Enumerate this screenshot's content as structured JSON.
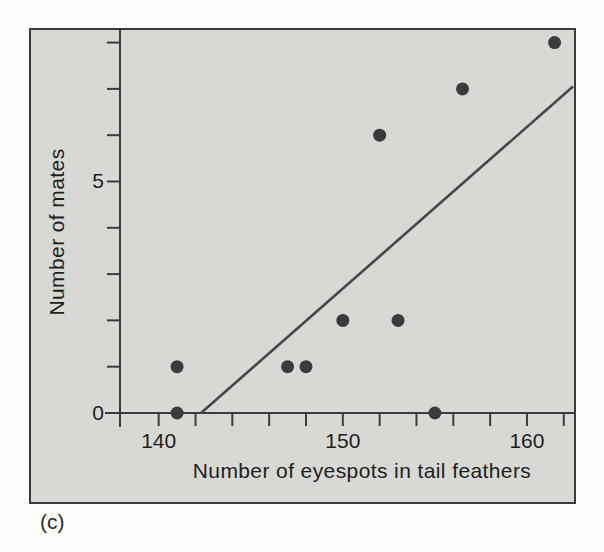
{
  "figure": {
    "caption": "(c)",
    "colors": {
      "page_bg": "#fcfcfa",
      "panel_bg": "#d8d8d4",
      "frame": "#3b3b3b",
      "text": "#1e1e1e"
    }
  },
  "chart_data": {
    "type": "scatter",
    "xlabel": "Number of eyespots in tail feathers",
    "ylabel": "Number of mates",
    "xlim": [
      137.9,
      162.5
    ],
    "ylim": [
      0,
      8.25
    ],
    "x_ticks": [
      140,
      142,
      144,
      146,
      148,
      150,
      152,
      154,
      156,
      158,
      160,
      162
    ],
    "y_ticks": [
      1,
      2,
      3,
      4,
      5,
      6,
      7,
      8
    ],
    "x_labeled_ticks": [
      140,
      150,
      160
    ],
    "y_labeled_ticks": [
      0,
      5
    ],
    "grid": false,
    "points": [
      {
        "x": 141,
        "y": 0
      },
      {
        "x": 141,
        "y": 1
      },
      {
        "x": 147,
        "y": 1
      },
      {
        "x": 148,
        "y": 1
      },
      {
        "x": 150,
        "y": 2
      },
      {
        "x": 153,
        "y": 2
      },
      {
        "x": 152,
        "y": 6
      },
      {
        "x": 155,
        "y": 0
      },
      {
        "x": 156.5,
        "y": 7
      },
      {
        "x": 161.5,
        "y": 8
      }
    ],
    "trendline": {
      "x1": 142.3,
      "y1": 0,
      "x2": 162.5,
      "y2": 7.05
    },
    "point_color": "#3b3b3b",
    "trendline_color": "#474747"
  }
}
